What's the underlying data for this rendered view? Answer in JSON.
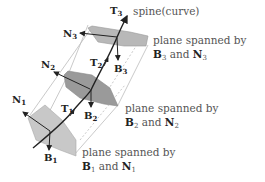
{
  "diagram": {
    "spine_label": "spine(curve)",
    "colors": {
      "plane_light": "#c8c8c8",
      "plane_dark": "#9a9a9a",
      "line": "#222222",
      "text": "#555555",
      "guide": "#bbbbbb"
    },
    "frames": [
      {
        "index": "1",
        "T": "T",
        "T_sub": "1",
        "N": "N",
        "N_sub": "1",
        "B": "B",
        "B_sub": "1",
        "plane_caption_line1": "plane spanned by",
        "plane_caption_B": "B",
        "plane_caption_B_sub": "1",
        "plane_caption_and": "and",
        "plane_caption_N": "N",
        "plane_caption_N_sub": "1"
      },
      {
        "index": "2",
        "T": "T",
        "T_sub": "2",
        "N": "N",
        "N_sub": "2",
        "B": "B",
        "B_sub": "2",
        "plane_caption_line1": "plane spanned by",
        "plane_caption_B": "B",
        "plane_caption_B_sub": "2",
        "plane_caption_and": "and",
        "plane_caption_N": "N",
        "plane_caption_N_sub": "2"
      },
      {
        "index": "3",
        "T": "T",
        "T_sub": "3",
        "N": "N",
        "N_sub": "3",
        "B": "B",
        "B_sub": "3",
        "plane_caption_line1": "plane spanned by",
        "plane_caption_B": "B",
        "plane_caption_B_sub": "3",
        "plane_caption_and": "and",
        "plane_caption_N": "N",
        "plane_caption_N_sub": "3"
      }
    ]
  }
}
